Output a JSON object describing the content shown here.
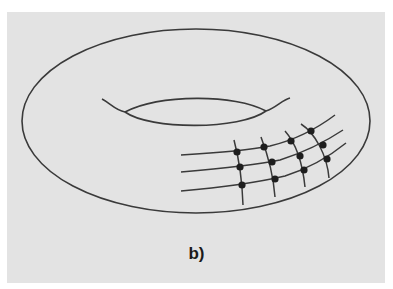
{
  "figure": {
    "caption": "b)",
    "colors": {
      "background": "#ffffff",
      "panel": "#e3e3e3",
      "stroke": "#3a3a3a",
      "node": "#1e1e1e"
    }
  },
  "torus": {
    "outer_ellipse": {
      "cx": 196,
      "cy": 121,
      "rx": 174,
      "ry": 92
    },
    "inner_hole": {
      "upper_arc": "M102,99 C110,103 115,110 125,112 C160,94 235,94 266,111 C276,108 282,100 290,98",
      "lower_arc": "M125,112 C150,130 240,130 266,111"
    }
  },
  "grid": {
    "horizontal_lines": [
      "M181,155 C215,153 250,150 270,146 C295,140 315,130 335,115",
      "M181,172 C215,169 255,165 280,160 C305,152 325,142 343,130",
      "M181,191 C215,188 255,183 285,176 C310,168 330,156 346,143"
    ],
    "vertical_lines": [
      "M234,140 C238,155 242,175 243,205",
      "M261,137 C266,150 273,170 275,197",
      "M285,131 C293,140 302,158 305,187",
      "M301,124 C315,133 327,155 329,178"
    ],
    "nodes": [
      {
        "x": 237,
        "y": 152
      },
      {
        "x": 264,
        "y": 147
      },
      {
        "x": 291,
        "y": 141
      },
      {
        "x": 311,
        "y": 131
      },
      {
        "x": 240,
        "y": 167
      },
      {
        "x": 272,
        "y": 162
      },
      {
        "x": 300,
        "y": 156
      },
      {
        "x": 323,
        "y": 145
      },
      {
        "x": 242,
        "y": 185
      },
      {
        "x": 275,
        "y": 179
      },
      {
        "x": 304,
        "y": 170
      },
      {
        "x": 327,
        "y": 159
      }
    ]
  }
}
